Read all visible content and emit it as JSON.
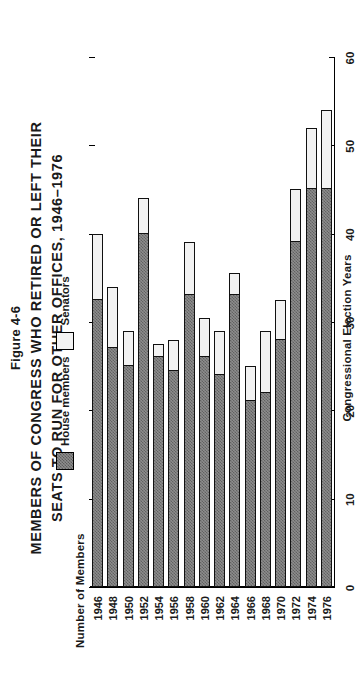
{
  "figure": {
    "number": "Figure 4-6",
    "title_line1": "MEMBERS OF CONGRESS WHO RETIRED OR LEFT THEIR",
    "title_line2": "SEATS TO RUN FOR OTHER OFFICES, 1946–1976"
  },
  "legend": {
    "house_label": "House members",
    "senators_label": "Senators",
    "house_color": "#8d8d8d",
    "senators_color": "#f2f2f2"
  },
  "axes": {
    "value_axis_title": "Number of Members",
    "category_axis_title": "Congressional Election Years",
    "value_ticks": [
      "0",
      "10",
      "20",
      "30",
      "40",
      "50",
      "60"
    ]
  },
  "chart_data": {
    "type": "bar",
    "title": "MEMBERS OF CONGRESS WHO RETIRED OR LEFT THEIR SEATS TO RUN FOR OTHER OFFICES, 1946–1976",
    "subtitle": "Figure 4-6",
    "orientation": "vertical",
    "stacked": true,
    "xlabel": "Congressional Election Years",
    "ylabel": "Number of Members",
    "ylim": [
      0,
      60
    ],
    "yticks": [
      0,
      10,
      20,
      30,
      40,
      50,
      60
    ],
    "grid": false,
    "legend_position": "top-center",
    "categories": [
      "1946",
      "1948",
      "1950",
      "1952",
      "1954",
      "1956",
      "1958",
      "1960",
      "1962",
      "1964",
      "1966",
      "1968",
      "1970",
      "1972",
      "1974",
      "1976"
    ],
    "series": [
      {
        "name": "House members",
        "color": "#8d8d8d",
        "values": [
          32.5,
          27,
          25,
          40,
          26,
          24.5,
          33,
          26,
          24,
          33,
          21,
          22,
          28,
          39,
          45,
          45
        ]
      },
      {
        "name": "Senators",
        "color": "#f2f2f2",
        "values": [
          7.5,
          7,
          4,
          4,
          1.5,
          3.5,
          6,
          4.5,
          5,
          2.5,
          4,
          7,
          4.5,
          6,
          7,
          9
        ]
      }
    ],
    "totals": [
      40,
      34,
      29,
      44,
      27.5,
      28,
      39,
      30.5,
      29,
      35.5,
      25,
      29,
      32.5,
      45,
      52,
      54
    ]
  }
}
